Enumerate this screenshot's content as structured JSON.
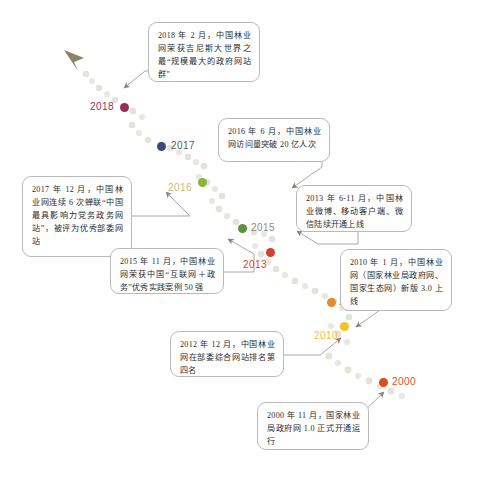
{
  "infographic": {
    "title": "中国林业网发展历程时间轴",
    "path": {
      "style": "dotted",
      "dot_color": "#e3e3db",
      "arrow_color": "#8a8570",
      "direction": "bottom-right to top-left"
    },
    "connector": {
      "line_color": "#9a9a9a",
      "arrow_color": "#8c8677"
    },
    "events": [
      {
        "id": "event-2018",
        "year": "2018",
        "year_color": "#9a2c5c",
        "dot_color": "#9a2c5c",
        "text": "2018 年 2 月，中国林业网荣获吉尼斯大世界之最“规模最大的政府网站群”"
      },
      {
        "id": "event-2017",
        "year": "2017",
        "year_color": "#555555",
        "dot_color": "#3b4a7a",
        "text": "2017 年 12 月，中国林业网连续 6 次蝉联“中国最具影响力党务政务网站”，被评为优秀部委网站"
      },
      {
        "id": "event-2016",
        "year": "2016",
        "year_color": "#c8b97a",
        "dot_color": "#8cb33c",
        "text": "2016 年 6 月，中国林业网访问量突破 20 亿人次"
      },
      {
        "id": "event-2015",
        "year": "2015",
        "year_color": "#8a8a7a",
        "dot_color": "#5f9042",
        "text": "2015 年 11 月，中国林业网荣获中国“互联网＋政务”优秀实践案例 50 强"
      },
      {
        "id": "event-2013",
        "year": "2013",
        "year_color": "#d6472f",
        "dot_color": "#d6402c",
        "text": "2013 年 6-11 月，中国林业微博、移动客户端、微信陆续开通上线"
      },
      {
        "id": "event-2012",
        "year": "2012",
        "year_color": "#e08b2e",
        "dot_color": "#e88b2c",
        "text": "2012 年 12 月，中国林业网在部委综合网站排名第四名"
      },
      {
        "id": "event-2010",
        "year": "2010",
        "year_color": "#f0c040",
        "dot_color": "#f5c02c",
        "text": "2010 年 1 月，中国林业网（国家林业局政府网、国家生态网）新版 3.0 上线"
      },
      {
        "id": "event-2000",
        "year": "2000",
        "year_color": "#e0502a",
        "dot_color": "#e04a22",
        "text": "2000 年 11 月，国家林业局政府网 1.0 正式开通运行"
      }
    ]
  }
}
